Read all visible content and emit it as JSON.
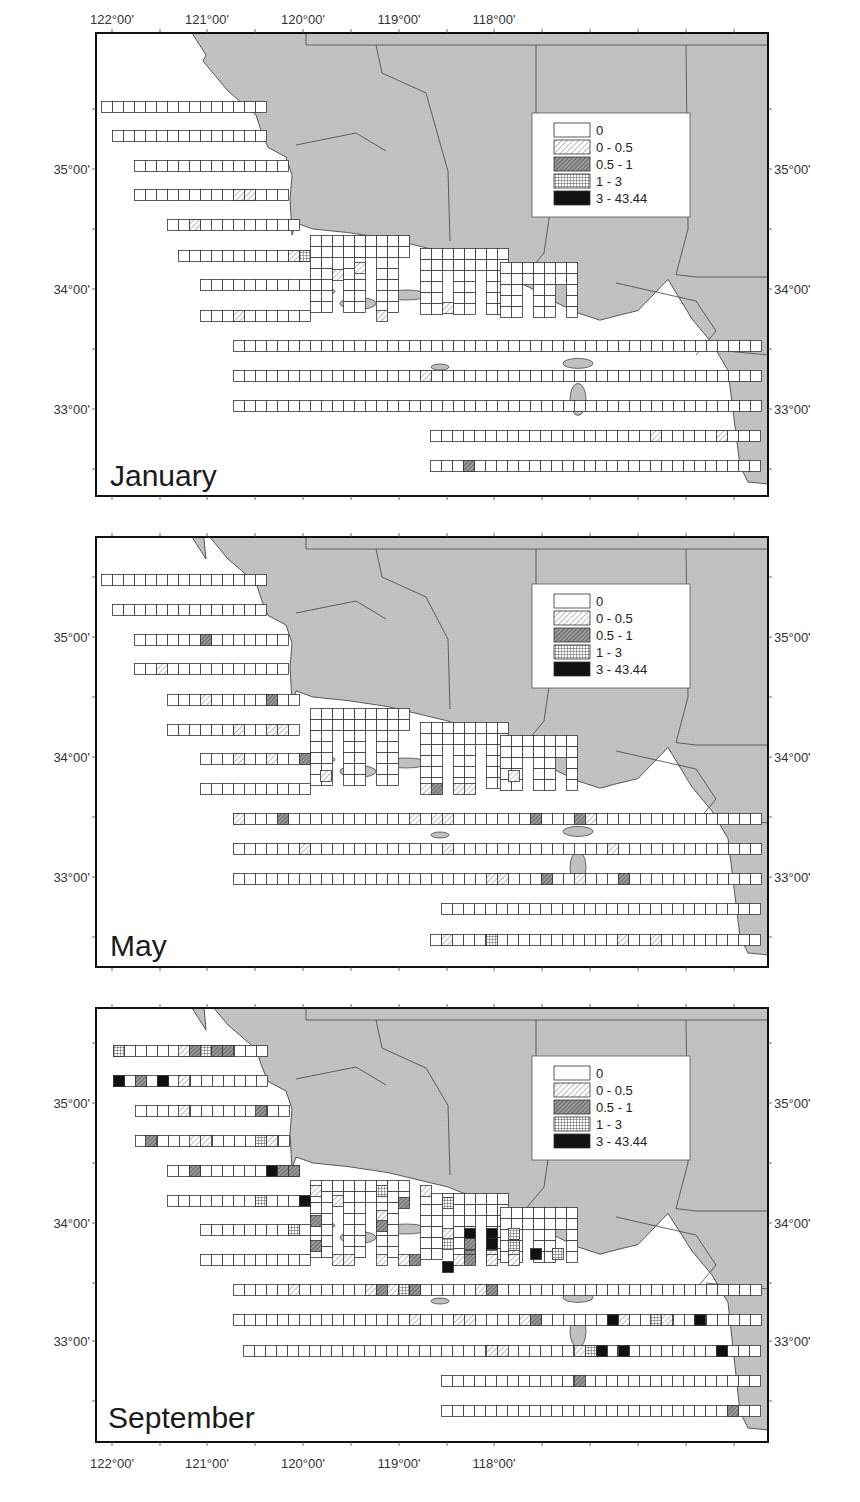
{
  "chart_data": {
    "type": "heatmap",
    "title": "",
    "x_axis": {
      "label": "",
      "ticks": [
        "122°00'",
        "121°00'",
        "120°00'",
        "119°00'",
        "118°00'"
      ],
      "tick_values": [
        122,
        121,
        120,
        119,
        118
      ],
      "px": [
        112,
        207,
        303,
        399,
        494
      ],
      "position": [
        "top",
        "bottom"
      ]
    },
    "y_axis": {
      "label": "",
      "ticks": [
        "35°00'",
        "34°00'",
        "33°00'"
      ],
      "tick_values": [
        35,
        34,
        33
      ],
      "position": [
        "left",
        "right"
      ]
    },
    "legend": {
      "position": "upper-right inset",
      "entries": [
        {
          "label": "0",
          "pattern": "empty"
        },
        {
          "label": "0 - 0.5",
          "pattern": "light-hatch"
        },
        {
          "label": "0.5 - 1",
          "pattern": "dark-hatch"
        },
        {
          "label": "1 - 3",
          "pattern": "crosshatch"
        },
        {
          "label": "3 - 43.44",
          "pattern": "solid"
        }
      ]
    },
    "value_classes": [
      "0",
      "0 - 0.5",
      "0.5 - 1",
      "1 - 3",
      "3 - 43.44"
    ],
    "panels": [
      {
        "name": "January",
        "frame": {
          "x": 96,
          "y": 33,
          "w": 672,
          "h": 463
        },
        "lat_px": {
          "35": 169,
          "34": 289,
          "33": 409
        },
        "legend_box": {
          "x": 532,
          "y": 113,
          "w": 158,
          "h": 104
        },
        "label_pos": {
          "x": 110,
          "y": 486
        },
        "rows": [
          {
            "x": 101,
            "y": 101,
            "n": 15
          },
          {
            "x": 112,
            "y": 130,
            "n": 14
          },
          {
            "x": 134,
            "y": 160,
            "n": 14
          },
          {
            "x": 134,
            "y": 189,
            "n": 14
          },
          {
            "x": 167,
            "y": 219,
            "n": 12
          },
          {
            "x": 178,
            "y": 250,
            "n": 12
          },
          {
            "x": 200,
            "y": 279,
            "n": 10
          },
          {
            "x": 200,
            "y": 310,
            "n": 10
          },
          {
            "x": 233,
            "y": 340,
            "n": 49
          },
          {
            "x": 233,
            "y": 370,
            "n": 49
          },
          {
            "x": 233,
            "y": 400,
            "n": 50
          },
          {
            "x": 430,
            "y": 430,
            "n": 32
          },
          {
            "x": 430,
            "y": 460,
            "n": 30
          }
        ],
        "coastal_blocks": [
          {
            "x": 310,
            "y": 235,
            "cols": 9,
            "rows": 7
          },
          {
            "x": 420,
            "y": 248,
            "cols": 8,
            "rows": 6
          },
          {
            "x": 500,
            "y": 262,
            "cols": 7,
            "rows": 5
          }
        ],
        "cells": [
          {
            "x": 233,
            "y": 189,
            "c": 1
          },
          {
            "x": 244,
            "y": 189,
            "c": 1
          },
          {
            "x": 189,
            "y": 219,
            "c": 1
          },
          {
            "x": 288,
            "y": 250,
            "c": 1
          },
          {
            "x": 299,
            "y": 250,
            "c": 3
          },
          {
            "x": 332,
            "y": 269,
            "c": 1
          },
          {
            "x": 354,
            "y": 262,
            "c": 1
          },
          {
            "x": 233,
            "y": 310,
            "c": 1
          },
          {
            "x": 376,
            "y": 310,
            "c": 1
          },
          {
            "x": 442,
            "y": 302,
            "c": 1
          },
          {
            "x": 420,
            "y": 370,
            "c": 1
          },
          {
            "x": 650,
            "y": 430,
            "c": 1
          },
          {
            "x": 716,
            "y": 430,
            "c": 1
          },
          {
            "x": 463,
            "y": 460,
            "c": 2
          }
        ]
      },
      {
        "name": "May",
        "frame": {
          "x": 96,
          "y": 537,
          "w": 672,
          "h": 430
        },
        "lat_px": {
          "35": 637,
          "34": 757,
          "33": 877
        },
        "legend_box": {
          "x": 532,
          "y": 584,
          "w": 158,
          "h": 104
        },
        "label_pos": {
          "x": 110,
          "y": 956
        },
        "rows": [
          {
            "x": 101,
            "y": 574,
            "n": 15
          },
          {
            "x": 112,
            "y": 604,
            "n": 14
          },
          {
            "x": 134,
            "y": 634,
            "n": 14
          },
          {
            "x": 134,
            "y": 663,
            "n": 14
          },
          {
            "x": 167,
            "y": 694,
            "n": 12
          },
          {
            "x": 167,
            "y": 724,
            "n": 12
          },
          {
            "x": 200,
            "y": 753,
            "n": 10
          },
          {
            "x": 200,
            "y": 783,
            "n": 10
          },
          {
            "x": 233,
            "y": 813,
            "n": 49
          },
          {
            "x": 233,
            "y": 843,
            "n": 49
          },
          {
            "x": 233,
            "y": 873,
            "n": 50
          },
          {
            "x": 441,
            "y": 903,
            "n": 30
          },
          {
            "x": 430,
            "y": 934,
            "n": 31
          }
        ],
        "coastal_blocks": [
          {
            "x": 310,
            "y": 708,
            "cols": 9,
            "rows": 7
          },
          {
            "x": 420,
            "y": 722,
            "cols": 8,
            "rows": 6
          },
          {
            "x": 500,
            "y": 735,
            "cols": 7,
            "rows": 5
          }
        ],
        "cells": [
          {
            "x": 200,
            "y": 634,
            "c": 2
          },
          {
            "x": 156,
            "y": 663,
            "c": 1
          },
          {
            "x": 200,
            "y": 694,
            "c": 1
          },
          {
            "x": 266,
            "y": 694,
            "c": 2
          },
          {
            "x": 233,
            "y": 724,
            "c": 1
          },
          {
            "x": 266,
            "y": 724,
            "c": 1
          },
          {
            "x": 277,
            "y": 724,
            "c": 1
          },
          {
            "x": 233,
            "y": 753,
            "c": 1
          },
          {
            "x": 266,
            "y": 753,
            "c": 1
          },
          {
            "x": 299,
            "y": 753,
            "c": 2
          },
          {
            "x": 320,
            "y": 770,
            "c": 1
          },
          {
            "x": 420,
            "y": 783,
            "c": 1
          },
          {
            "x": 431,
            "y": 783,
            "c": 2
          },
          {
            "x": 453,
            "y": 783,
            "c": 1
          },
          {
            "x": 464,
            "y": 783,
            "c": 1
          },
          {
            "x": 508,
            "y": 770,
            "c": 1
          },
          {
            "x": 233,
            "y": 813,
            "c": 1
          },
          {
            "x": 277,
            "y": 813,
            "c": 2
          },
          {
            "x": 409,
            "y": 813,
            "c": 1
          },
          {
            "x": 431,
            "y": 813,
            "c": 1
          },
          {
            "x": 442,
            "y": 813,
            "c": 1
          },
          {
            "x": 530,
            "y": 813,
            "c": 2
          },
          {
            "x": 574,
            "y": 813,
            "c": 2
          },
          {
            "x": 585,
            "y": 813,
            "c": 1
          },
          {
            "x": 299,
            "y": 843,
            "c": 1
          },
          {
            "x": 442,
            "y": 843,
            "c": 1
          },
          {
            "x": 607,
            "y": 843,
            "c": 1
          },
          {
            "x": 486,
            "y": 873,
            "c": 1
          },
          {
            "x": 497,
            "y": 873,
            "c": 1
          },
          {
            "x": 541,
            "y": 873,
            "c": 2
          },
          {
            "x": 574,
            "y": 873,
            "c": 1
          },
          {
            "x": 618,
            "y": 873,
            "c": 2
          },
          {
            "x": 441,
            "y": 934,
            "c": 1
          },
          {
            "x": 486,
            "y": 934,
            "c": 3
          },
          {
            "x": 617,
            "y": 934,
            "c": 1
          },
          {
            "x": 650,
            "y": 934,
            "c": 1
          }
        ]
      },
      {
        "name": "September",
        "frame": {
          "x": 96,
          "y": 1008,
          "w": 672,
          "h": 434
        },
        "lat_px": {
          "35": 1103,
          "34": 1223,
          "33": 1341
        },
        "legend_box": {
          "x": 532,
          "y": 1056,
          "w": 158,
          "h": 104
        },
        "label_pos": {
          "x": 108,
          "y": 1428
        },
        "rows": [
          {
            "x": 113,
            "y": 1045,
            "n": 14
          },
          {
            "x": 113,
            "y": 1075,
            "n": 14
          },
          {
            "x": 135,
            "y": 1105,
            "n": 14
          },
          {
            "x": 135,
            "y": 1135,
            "n": 14
          },
          {
            "x": 167,
            "y": 1165,
            "n": 12
          },
          {
            "x": 167,
            "y": 1195,
            "n": 12
          },
          {
            "x": 200,
            "y": 1224,
            "n": 10
          },
          {
            "x": 200,
            "y": 1254,
            "n": 10
          },
          {
            "x": 233,
            "y": 1284,
            "n": 49
          },
          {
            "x": 233,
            "y": 1314,
            "n": 49
          },
          {
            "x": 243,
            "y": 1345,
            "n": 48
          },
          {
            "x": 441,
            "y": 1375,
            "n": 30
          },
          {
            "x": 441,
            "y": 1405,
            "n": 31
          }
        ],
        "coastal_blocks": [
          {
            "x": 310,
            "y": 1180,
            "cols": 9,
            "rows": 7
          },
          {
            "x": 420,
            "y": 1193,
            "cols": 8,
            "rows": 6
          },
          {
            "x": 500,
            "y": 1207,
            "cols": 7,
            "rows": 5
          }
        ],
        "cells": [
          {
            "x": 113,
            "y": 1045,
            "c": 3
          },
          {
            "x": 178,
            "y": 1045,
            "c": 1
          },
          {
            "x": 189,
            "y": 1045,
            "c": 2
          },
          {
            "x": 200,
            "y": 1045,
            "c": 3
          },
          {
            "x": 211,
            "y": 1045,
            "c": 2
          },
          {
            "x": 222,
            "y": 1045,
            "c": 2
          },
          {
            "x": 113,
            "y": 1075,
            "c": 4
          },
          {
            "x": 135,
            "y": 1075,
            "c": 2
          },
          {
            "x": 157,
            "y": 1075,
            "c": 4
          },
          {
            "x": 178,
            "y": 1075,
            "c": 1
          },
          {
            "x": 178,
            "y": 1105,
            "c": 1
          },
          {
            "x": 255,
            "y": 1105,
            "c": 2
          },
          {
            "x": 145,
            "y": 1135,
            "c": 2
          },
          {
            "x": 189,
            "y": 1135,
            "c": 1
          },
          {
            "x": 200,
            "y": 1135,
            "c": 1
          },
          {
            "x": 255,
            "y": 1135,
            "c": 3
          },
          {
            "x": 266,
            "y": 1135,
            "c": 1
          },
          {
            "x": 189,
            "y": 1165,
            "c": 2
          },
          {
            "x": 266,
            "y": 1165,
            "c": 4
          },
          {
            "x": 277,
            "y": 1165,
            "c": 2
          },
          {
            "x": 288,
            "y": 1165,
            "c": 2
          },
          {
            "x": 255,
            "y": 1195,
            "c": 3
          },
          {
            "x": 299,
            "y": 1195,
            "c": 4
          },
          {
            "x": 310,
            "y": 1185,
            "c": 1
          },
          {
            "x": 332,
            "y": 1195,
            "c": 1
          },
          {
            "x": 288,
            "y": 1224,
            "c": 3
          },
          {
            "x": 310,
            "y": 1215,
            "c": 2
          },
          {
            "x": 310,
            "y": 1240,
            "c": 2
          },
          {
            "x": 376,
            "y": 1185,
            "c": 3
          },
          {
            "x": 376,
            "y": 1210,
            "c": 1
          },
          {
            "x": 376,
            "y": 1220,
            "c": 2
          },
          {
            "x": 398,
            "y": 1197,
            "c": 2
          },
          {
            "x": 420,
            "y": 1185,
            "c": 1
          },
          {
            "x": 442,
            "y": 1197,
            "c": 3
          },
          {
            "x": 442,
            "y": 1228,
            "c": 1
          },
          {
            "x": 442,
            "y": 1238,
            "c": 3
          },
          {
            "x": 464,
            "y": 1228,
            "c": 4
          },
          {
            "x": 464,
            "y": 1238,
            "c": 2
          },
          {
            "x": 464,
            "y": 1250,
            "c": 2
          },
          {
            "x": 486,
            "y": 1228,
            "c": 4
          },
          {
            "x": 486,
            "y": 1238,
            "c": 4
          },
          {
            "x": 486,
            "y": 1250,
            "c": 1
          },
          {
            "x": 508,
            "y": 1228,
            "c": 3
          },
          {
            "x": 508,
            "y": 1240,
            "c": 3
          },
          {
            "x": 508,
            "y": 1250,
            "c": 1
          },
          {
            "x": 530,
            "y": 1248,
            "c": 4
          },
          {
            "x": 552,
            "y": 1248,
            "c": 3
          },
          {
            "x": 332,
            "y": 1254,
            "c": 1
          },
          {
            "x": 343,
            "y": 1254,
            "c": 1
          },
          {
            "x": 376,
            "y": 1254,
            "c": 1
          },
          {
            "x": 398,
            "y": 1254,
            "c": 1
          },
          {
            "x": 409,
            "y": 1254,
            "c": 2
          },
          {
            "x": 442,
            "y": 1261,
            "c": 4
          },
          {
            "x": 453,
            "y": 1254,
            "c": 1
          },
          {
            "x": 464,
            "y": 1254,
            "c": 2
          },
          {
            "x": 486,
            "y": 1254,
            "c": 1
          },
          {
            "x": 508,
            "y": 1254,
            "c": 1
          },
          {
            "x": 288,
            "y": 1284,
            "c": 1
          },
          {
            "x": 365,
            "y": 1284,
            "c": 1
          },
          {
            "x": 376,
            "y": 1284,
            "c": 2
          },
          {
            "x": 387,
            "y": 1284,
            "c": 1
          },
          {
            "x": 398,
            "y": 1284,
            "c": 3
          },
          {
            "x": 409,
            "y": 1284,
            "c": 2
          },
          {
            "x": 475,
            "y": 1284,
            "c": 1
          },
          {
            "x": 486,
            "y": 1284,
            "c": 2
          },
          {
            "x": 409,
            "y": 1314,
            "c": 1
          },
          {
            "x": 453,
            "y": 1314,
            "c": 1
          },
          {
            "x": 464,
            "y": 1314,
            "c": 1
          },
          {
            "x": 519,
            "y": 1314,
            "c": 1
          },
          {
            "x": 530,
            "y": 1314,
            "c": 2
          },
          {
            "x": 607,
            "y": 1314,
            "c": 4
          },
          {
            "x": 618,
            "y": 1314,
            "c": 1
          },
          {
            "x": 650,
            "y": 1314,
            "c": 3
          },
          {
            "x": 661,
            "y": 1314,
            "c": 1
          },
          {
            "x": 694,
            "y": 1314,
            "c": 4
          },
          {
            "x": 486,
            "y": 1345,
            "c": 1
          },
          {
            "x": 497,
            "y": 1345,
            "c": 1
          },
          {
            "x": 574,
            "y": 1345,
            "c": 1
          },
          {
            "x": 585,
            "y": 1345,
            "c": 3
          },
          {
            "x": 596,
            "y": 1345,
            "c": 4
          },
          {
            "x": 618,
            "y": 1345,
            "c": 4
          },
          {
            "x": 716,
            "y": 1345,
            "c": 4
          },
          {
            "x": 574,
            "y": 1375,
            "c": 2
          },
          {
            "x": 727,
            "y": 1405,
            "c": 2
          }
        ]
      }
    ]
  }
}
